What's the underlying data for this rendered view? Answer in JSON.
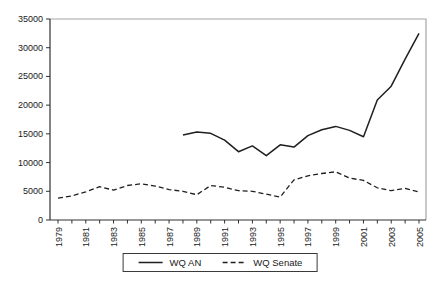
{
  "chart_data": {
    "type": "line",
    "title": "",
    "xlabel": "",
    "ylabel": "",
    "x": [
      1979,
      1980,
      1981,
      1982,
      1983,
      1984,
      1985,
      1986,
      1987,
      1988,
      1989,
      1990,
      1991,
      1992,
      1993,
      1994,
      1995,
      1996,
      1997,
      1998,
      1999,
      2000,
      2001,
      2002,
      2003,
      2004,
      2005
    ],
    "x_tick_labels": [
      "1979",
      "1981",
      "1983",
      "1985",
      "1987",
      "1989",
      "1991",
      "1993",
      "1995",
      "1997",
      "1999",
      "2001",
      "2003",
      "2005"
    ],
    "series": [
      {
        "name": "WQ AN",
        "style": "solid",
        "color": "#1f1f1f",
        "values": [
          null,
          null,
          null,
          null,
          null,
          null,
          null,
          null,
          null,
          14800,
          15300,
          15100,
          13900,
          11900,
          12900,
          11200,
          13100,
          12700,
          14700,
          15700,
          16300,
          15600,
          14500,
          20900,
          23300,
          28000,
          32500
        ]
      },
      {
        "name": "WQ Senate",
        "style": "dashed",
        "color": "#1f1f1f",
        "values": [
          3800,
          4200,
          4900,
          5800,
          5200,
          6000,
          6300,
          5900,
          5300,
          5000,
          4400,
          6000,
          5700,
          5100,
          5000,
          4500,
          4000,
          7000,
          7700,
          8100,
          8400,
          7300,
          6900,
          5600,
          5100,
          5500,
          4900
        ]
      }
    ],
    "ylim": [
      0,
      35000
    ],
    "y_ticks": [
      0,
      5000,
      10000,
      15000,
      20000,
      25000,
      30000,
      35000
    ],
    "y_tick_labels": [
      "0",
      "5000",
      "10000",
      "15000",
      "20000",
      "25000",
      "30000",
      "35000"
    ],
    "grid": false,
    "legend_position": "bottom-center",
    "background": "#ffffff",
    "axis_color": "#303030",
    "frame_color": "#a6a6a6"
  },
  "legend": {
    "items": [
      {
        "label": "WQ AN",
        "line": "solid"
      },
      {
        "label": "WQ Senate",
        "line": "dashed"
      }
    ]
  }
}
